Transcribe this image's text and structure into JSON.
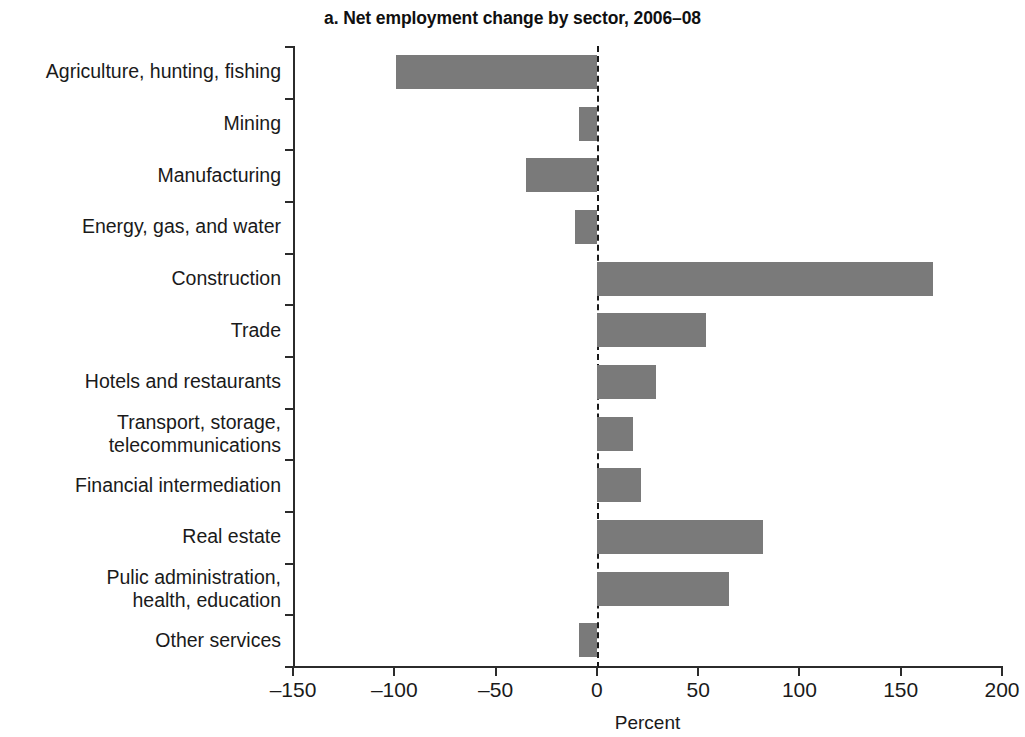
{
  "chart_data": {
    "type": "bar",
    "orientation": "horizontal",
    "title": "a. Net employment change by sector, 2006–08",
    "xlabel": "Percent",
    "ylabel": "",
    "xlim": [
      -150,
      200
    ],
    "xticks": [
      -150,
      -100,
      -50,
      0,
      50,
      100,
      150,
      200
    ],
    "xtick_labels": [
      "–150",
      "–100",
      "–50",
      "0",
      "50",
      "100",
      "150",
      "200"
    ],
    "grid": false,
    "legend": null,
    "zero_reference_line": true,
    "bar_color": "#7a7a7a",
    "categories": [
      "Agriculture, hunting, fishing",
      "Mining",
      "Manufacturing",
      "Energy, gas, and water",
      "Construction",
      "Trade",
      "Hotels and restaurants",
      "Transport, storage,\ntelecommunications",
      "Financial intermediation",
      "Real estate",
      "Pulic administration,\nhealth, education",
      "Other services"
    ],
    "values": [
      -99,
      -9,
      -35,
      -11,
      166,
      54,
      29,
      18,
      22,
      82,
      65,
      -9
    ]
  },
  "axis": {
    "x_title": "Percent"
  }
}
